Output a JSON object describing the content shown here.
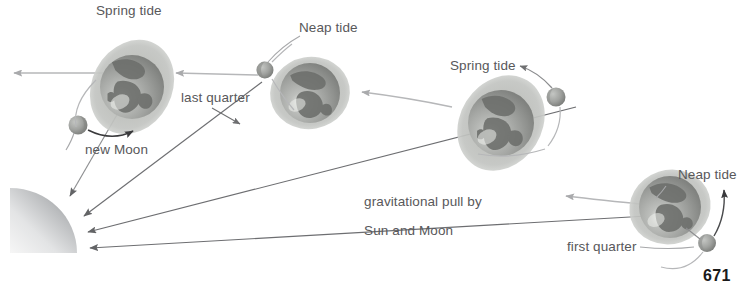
{
  "figure": {
    "page_number": "671",
    "colors": {
      "label_text": "#58585a",
      "pull_arrow": "#6d6e71",
      "orbit_arrow": "#b6b7b9",
      "leader_line": "#a7a8aa",
      "moon_orbit_arrow": "#3a3a3c",
      "earth_bulge": "#b9bbb8",
      "earth_ocean": "#9a9c99",
      "earth_land": "#6c6e6b",
      "moon_body": "#9d9f9c",
      "sun_light": "#f2f2f2",
      "sun_dark": "#7e8083"
    },
    "labels": [
      {
        "id": "spring-tide-left",
        "text": "Spring tide",
        "x": 96,
        "y": 4
      },
      {
        "id": "neap-tide-top",
        "text": "Neap tide",
        "x": 299,
        "y": 21
      },
      {
        "id": "last-quarter",
        "text": "last quarter",
        "x": 181,
        "y": 91
      },
      {
        "id": "new-moon",
        "text": "new Moon",
        "x": 85,
        "y": 143
      },
      {
        "id": "spring-tide-right",
        "text": "Spring tide",
        "x": 450,
        "y": 59
      },
      {
        "id": "neap-tide-right",
        "text": "Neap tide",
        "x": 678,
        "y": 168
      },
      {
        "id": "first-quarter",
        "text": "first quarter",
        "x": 567,
        "y": 240
      }
    ],
    "gravity_label": {
      "id": "gravitational-pull",
      "line1": "gravitational pull by",
      "line2": "Sun and Moon",
      "x": 341,
      "y": 180
    },
    "sun": {
      "id": "sun-quarter-disc",
      "label": "Sun"
    },
    "earths": [
      {
        "id": "earth-new-moon",
        "tide": "Spring tide",
        "moon_phase": "new Moon"
      },
      {
        "id": "earth-last-quarter",
        "tide": "Neap tide",
        "moon_phase": "last quarter"
      },
      {
        "id": "earth-full-moon",
        "tide": "Spring tide",
        "moon_phase": "full Moon"
      },
      {
        "id": "earth-first-quarter",
        "tide": "Neap tide",
        "moon_phase": "first quarter"
      }
    ],
    "moons": [
      {
        "id": "moon-new",
        "phase": "new Moon"
      },
      {
        "id": "moon-last-quarter",
        "phase": "last quarter"
      },
      {
        "id": "moon-full",
        "phase": "full Moon"
      },
      {
        "id": "moon-first-quarter",
        "phase": "first quarter"
      }
    ]
  }
}
